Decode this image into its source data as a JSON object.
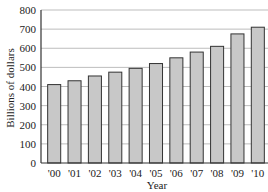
{
  "chart_data": {
    "type": "bar",
    "title": "",
    "xlabel": "Year",
    "ylabel": "Billions of dollars",
    "ylim": [
      0,
      800
    ],
    "yticks": [
      0,
      100,
      200,
      300,
      400,
      500,
      600,
      700,
      800
    ],
    "grid": true,
    "categories": [
      "'00",
      "'01",
      "'02",
      "'03",
      "'04",
      "'05",
      "'06",
      "'07",
      "'08",
      "'09",
      "'10"
    ],
    "values": [
      410,
      430,
      455,
      475,
      495,
      520,
      550,
      580,
      610,
      675,
      710
    ],
    "colors": {
      "bar_fill": "#c8c8c8",
      "bar_stroke": "#333333",
      "grid": "#bdbdbd",
      "axis": "#333333"
    }
  }
}
